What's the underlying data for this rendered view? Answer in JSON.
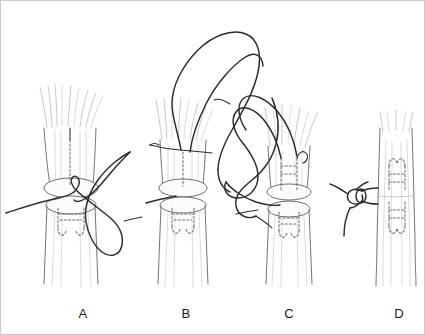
{
  "figure": {
    "style": "pen-and-ink medical line drawing",
    "background_color": "#ffffff",
    "ink_color": "#2b2b2b",
    "fiber_color": "#8c8c94",
    "dashed_color": "#6e6e76",
    "border_color": "#c9c9c9",
    "panel_count": 4
  },
  "labels": {
    "a": "A",
    "b": "B",
    "c": "C",
    "d": "D"
  },
  "panels": [
    {
      "id": "A",
      "label": "A",
      "caption_letter": "A",
      "stage": "First suture limb passed, loop held to the side",
      "elements": [
        "proximal-tendon-stump",
        "distal-tendon-stump",
        "cut-surface-ellipse",
        "dashed-intratendinous-suture",
        "suture-loop-right",
        "suture-tail-left"
      ]
    },
    {
      "id": "B",
      "label": "B",
      "caption_letter": "B",
      "stage": "Needle passed transversely, long suture loop drawn upward",
      "elements": [
        "proximal-tendon-stump",
        "distal-tendon-stump",
        "cut-surface-ellipse",
        "dashed-intratendinous-suture",
        "transverse-needle",
        "large-suture-loop-above",
        "suture-tail-left",
        "suture-strand-right"
      ]
    },
    {
      "id": "C",
      "label": "C",
      "caption_letter": "C",
      "stage": "Both suture limbs passed through both stumps",
      "elements": [
        "proximal-tendon-stump",
        "distal-tendon-stump",
        "cut-surface-ellipse",
        "dashed-intratendinous-suture-pair",
        "suture-strand-left",
        "suture-strand-right",
        "suture-free-end"
      ]
    },
    {
      "id": "D",
      "label": "D",
      "caption_letter": "D",
      "stage": "Repair completed, knot tied at the lateral tendon margin",
      "elements": [
        "continuous-tendon",
        "dashed-core-suture-grasp",
        "knot",
        "suture-tails"
      ]
    }
  ]
}
